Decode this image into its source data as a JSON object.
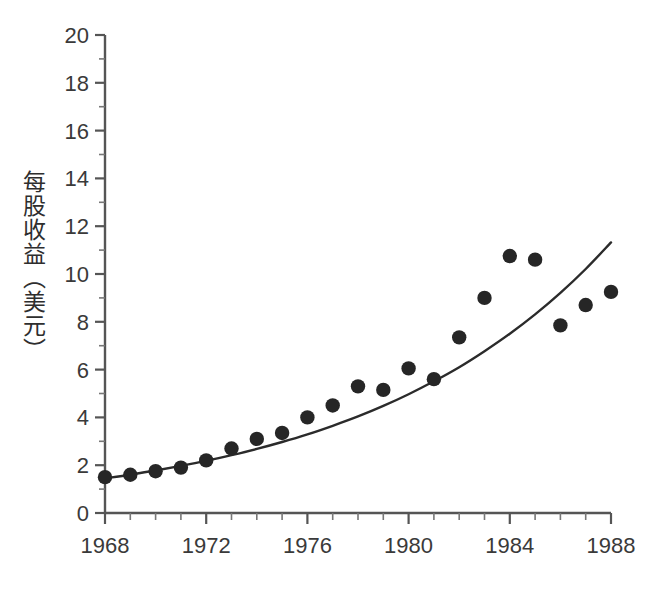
{
  "chart_data": {
    "type": "scatter",
    "title": "",
    "subtitle": "",
    "xlabel": "",
    "ylabel": "每股收益（美元）",
    "xlim": [
      1968,
      1988
    ],
    "ylim": [
      0,
      20
    ],
    "x_ticks": [
      1968,
      1972,
      1976,
      1980,
      1984,
      1988
    ],
    "x_tick_labels": [
      "1968",
      "1972",
      "1976",
      "1980",
      "1984",
      "1988"
    ],
    "x_minor_tick_step": 1,
    "y_ticks": [
      0,
      2,
      4,
      6,
      8,
      10,
      12,
      14,
      16,
      18,
      20
    ],
    "y_tick_labels": [
      "0",
      "2",
      "4",
      "6",
      "8",
      "10",
      "12",
      "14",
      "16",
      "18",
      "20"
    ],
    "y_minor_tick_step": 1,
    "grid": false,
    "legend": null,
    "legend_position": "none",
    "marker_color": "#262626",
    "line_color": "#2b2b2b",
    "axis_color": "#555555",
    "background_color": "#ffffff",
    "series": [
      {
        "name": "每股收益",
        "type": "scatter",
        "x": [
          1968,
          1969,
          1970,
          1971,
          1972,
          1973,
          1974,
          1975,
          1976,
          1977,
          1978,
          1979,
          1980,
          1981,
          1982,
          1983,
          1984,
          1985,
          1986,
          1987,
          1988
        ],
        "values": [
          1.5,
          1.6,
          1.75,
          1.9,
          2.2,
          2.7,
          3.1,
          3.35,
          4.0,
          4.5,
          5.3,
          5.15,
          6.05,
          5.6,
          7.35,
          9.0,
          10.75,
          10.6,
          7.85,
          8.7,
          9.25
        ]
      },
      {
        "name": "指数增长趋势线",
        "type": "line",
        "x": [
          1968,
          1969,
          1970,
          1971,
          1972,
          1973,
          1974,
          1975,
          1976,
          1977,
          1978,
          1979,
          1980,
          1981,
          1982,
          1983,
          1984,
          1985,
          1986,
          1987,
          1988
        ],
        "values": [
          1.45,
          1.6,
          1.78,
          1.97,
          2.18,
          2.42,
          2.68,
          2.97,
          3.29,
          3.65,
          4.04,
          4.48,
          4.97,
          5.51,
          6.1,
          6.77,
          7.5,
          8.31,
          9.21,
          10.21,
          11.32
        ]
      }
    ],
    "annotations": []
  },
  "caption": {
    "bottom_partial_text": ""
  }
}
